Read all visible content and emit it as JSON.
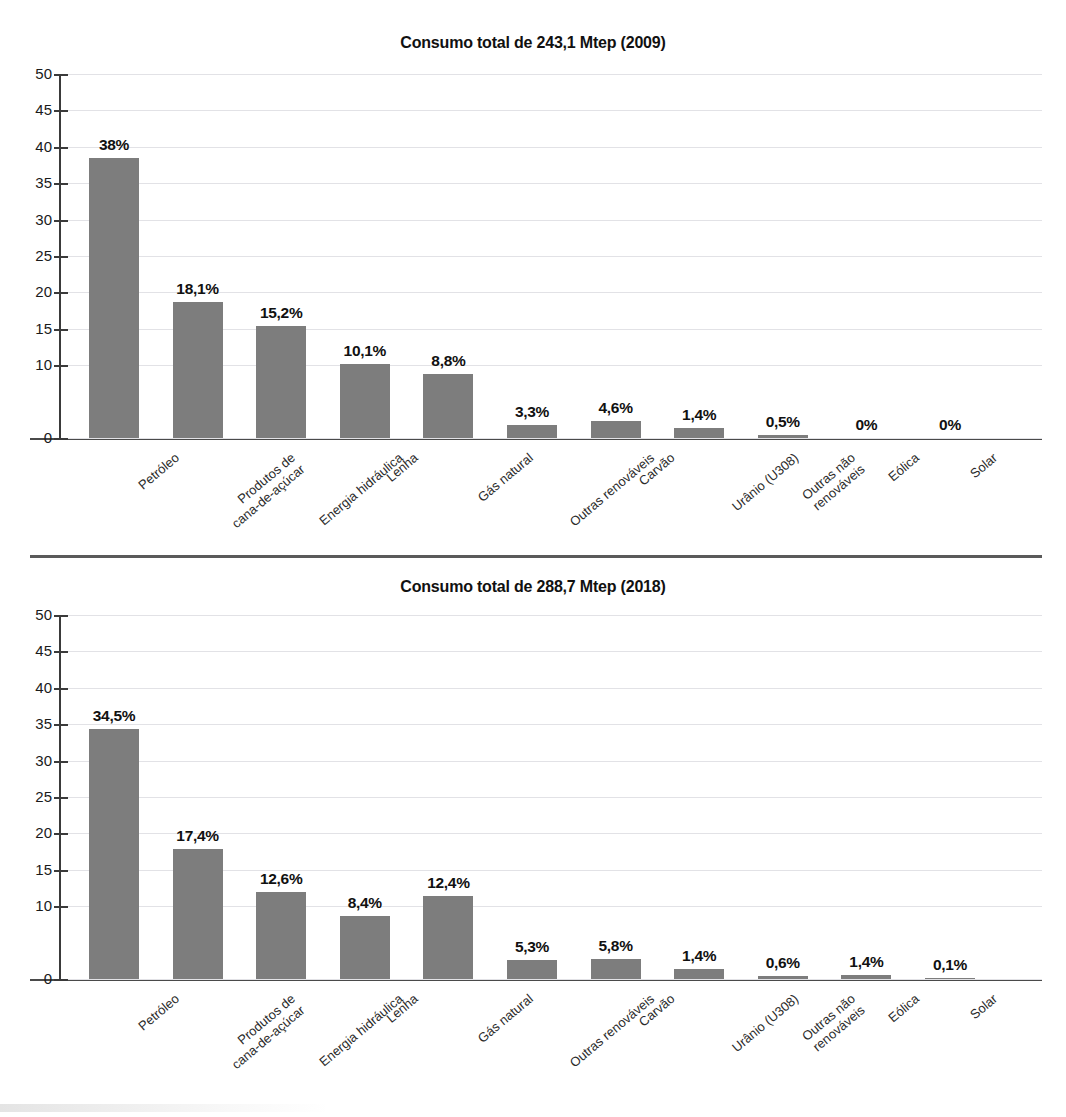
{
  "chart_data": [
    {
      "type": "bar",
      "title": "Consumo total de 243,1 Mtep (2009)",
      "xlabel": "",
      "ylabel": "",
      "ylim": [
        0,
        50
      ],
      "yticks": [
        50,
        45,
        40,
        35,
        30,
        25,
        20,
        15,
        10,
        0
      ],
      "grid": true,
      "legend": "none",
      "bar_color": "#7d7d7d",
      "categories": [
        "Petróleo",
        "Produtos de cana-de-açúcar",
        "Energia hidráulica",
        "Lenha",
        "Gás natural",
        "Outras renováveis",
        "Carvão",
        "Urânio (U308)",
        "Outras não renováveis",
        "Eólica",
        "Solar"
      ],
      "category_lines": [
        [
          "Petróleo"
        ],
        [
          "Produtos de",
          "cana-de-açúcar"
        ],
        [
          "Energia hidráulica"
        ],
        [
          "Lenha"
        ],
        [
          "Gás natural"
        ],
        [
          "Outras renováveis"
        ],
        [
          "Carvão"
        ],
        [
          "Urânio (U308)"
        ],
        [
          "Outras não",
          "renováveis"
        ],
        [
          "Eólica"
        ],
        [
          "Solar"
        ]
      ],
      "values": [
        38.4,
        18.7,
        15.4,
        10.1,
        8.8,
        1.8,
        2.4,
        1.4,
        0.4,
        0,
        0
      ],
      "data_labels": [
        "38%",
        "18,1%",
        "15,2%",
        "10,1%",
        "8,8%",
        "3,3%",
        "4,6%",
        "1,4%",
        "0,5%",
        "0%",
        "0%"
      ]
    },
    {
      "type": "bar",
      "title": "Consumo total de 288,7 Mtep (2018)",
      "xlabel": "",
      "ylabel": "",
      "ylim": [
        0,
        50
      ],
      "yticks": [
        50,
        45,
        40,
        35,
        30,
        25,
        20,
        15,
        10,
        0
      ],
      "grid": true,
      "legend": "none",
      "bar_color": "#7d7d7d",
      "categories": [
        "Petróleo",
        "Produtos de cana-de-açúcar",
        "Energia hidráulica",
        "Lenha",
        "Gás natural",
        "Outras renováveis",
        "Carvão",
        "Urânio (U308)",
        "Outras não renováveis",
        "Eólica",
        "Solar"
      ],
      "category_lines": [
        [
          "Petróleo"
        ],
        [
          "Produtos de",
          "cana-de-açúcar"
        ],
        [
          "Energia hidráulica"
        ],
        [
          "Lenha"
        ],
        [
          "Gás natural"
        ],
        [
          "Outras renováveis"
        ],
        [
          "Carvão"
        ],
        [
          "Urânio (U308)"
        ],
        [
          "Outras não",
          "renováveis"
        ],
        [
          "Eólica"
        ],
        [
          "Solar"
        ]
      ],
      "values": [
        34.4,
        17.9,
        11.9,
        8.7,
        11.4,
        2.6,
        2.8,
        1.4,
        0.4,
        0.6,
        0.1
      ],
      "data_labels": [
        "34,5%",
        "17,4%",
        "12,6%",
        "8,4%",
        "12,4%",
        "5,3%",
        "5,8%",
        "1,4%",
        "0,6%",
        "1,4%",
        "0,1%"
      ]
    }
  ]
}
